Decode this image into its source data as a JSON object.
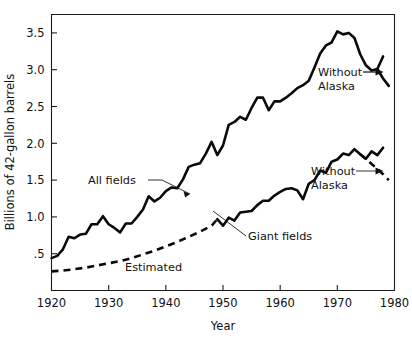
{
  "chart_data": {
    "type": "line",
    "title": "",
    "xlabel": "Year",
    "ylabel": "Billions of 42-gallon barrels",
    "xlim": [
      1920,
      1980
    ],
    "ylim": [
      0,
      3.75
    ],
    "grid": false,
    "legend_position": "inline-annotations",
    "x_ticks": [
      1920,
      1930,
      1940,
      1950,
      1960,
      1970,
      1980
    ],
    "x_tick_labels": [
      "1920",
      "1930",
      "1940",
      "1950",
      "1960",
      "1970",
      "1980"
    ],
    "y_ticks": [
      0.5,
      1.0,
      1.5,
      2.0,
      2.5,
      3.0,
      3.5
    ],
    "y_tick_labels": [
      ".5",
      "1.0",
      "1.5",
      "2.0",
      "2.5",
      "3.0",
      "3.5"
    ],
    "annotations": [
      {
        "text": "All fields",
        "x": 1931.0,
        "y": 1.62
      },
      {
        "text": "Without Alaska",
        "line1": "Without",
        "line2": "Alaska",
        "x": 1968.0,
        "y": 2.72
      },
      {
        "text": "Without Alaska",
        "line1": "Without",
        "line2": "Alaska",
        "x": 1967.0,
        "y": 1.52
      },
      {
        "text": "Giant fields",
        "x": 1956.5,
        "y": 0.7
      },
      {
        "text": "Estimated",
        "x": 1936.0,
        "y": 0.27
      }
    ],
    "series": [
      {
        "name": "All fields",
        "style": "solid",
        "x": [
          1920,
          1921,
          1922,
          1923,
          1924,
          1925,
          1926,
          1927,
          1928,
          1929,
          1930,
          1931,
          1932,
          1933,
          1934,
          1935,
          1936,
          1937,
          1938,
          1939,
          1940,
          1941,
          1942,
          1943,
          1944,
          1945,
          1946,
          1947,
          1948,
          1949,
          1950,
          1951,
          1952,
          1953,
          1954,
          1955,
          1956,
          1957,
          1958,
          1959,
          1960,
          1961,
          1962,
          1963,
          1964,
          1965,
          1966,
          1967,
          1968,
          1969,
          1970,
          1971,
          1972,
          1973,
          1974,
          1975,
          1976,
          1977,
          1978
        ],
        "values": [
          0.44,
          0.47,
          0.56,
          0.73,
          0.71,
          0.76,
          0.77,
          0.9,
          0.9,
          1.01,
          0.9,
          0.85,
          0.79,
          0.91,
          0.91,
          1.0,
          1.1,
          1.28,
          1.21,
          1.26,
          1.35,
          1.4,
          1.39,
          1.51,
          1.68,
          1.71,
          1.73,
          1.86,
          2.02,
          1.84,
          1.97,
          2.25,
          2.29,
          2.36,
          2.32,
          2.48,
          2.62,
          2.62,
          2.45,
          2.57,
          2.57,
          2.62,
          2.68,
          2.75,
          2.79,
          2.85,
          3.03,
          3.22,
          3.33,
          3.37,
          3.52,
          3.48,
          3.5,
          3.43,
          3.21,
          3.06,
          2.99,
          3.01,
          3.18
        ],
        "fork": {
          "at_year": 1977,
          "branch_name": "Without Alaska",
          "branch_style": "solid",
          "branch_x": [
            1977,
            1978,
            1979
          ],
          "branch_values": [
            3.01,
            2.88,
            2.78
          ]
        }
      },
      {
        "name": "Giant fields",
        "style": "dashed-then-solid",
        "estimated_until": 1949,
        "x": [
          1920,
          1922,
          1924,
          1926,
          1928,
          1930,
          1932,
          1934,
          1936,
          1938,
          1940,
          1942,
          1944,
          1946,
          1948,
          1949,
          1950,
          1951,
          1952,
          1953,
          1954,
          1955,
          1956,
          1957,
          1958,
          1959,
          1960,
          1961,
          1962,
          1963,
          1964,
          1965,
          1966,
          1967,
          1968,
          1969,
          1970,
          1971,
          1972,
          1973,
          1974,
          1975,
          1976,
          1977,
          1978
        ],
        "values": [
          0.26,
          0.27,
          0.29,
          0.31,
          0.34,
          0.37,
          0.4,
          0.44,
          0.49,
          0.54,
          0.6,
          0.66,
          0.73,
          0.8,
          0.88,
          0.97,
          0.88,
          0.99,
          0.95,
          1.06,
          1.07,
          1.08,
          1.16,
          1.22,
          1.22,
          1.29,
          1.34,
          1.38,
          1.39,
          1.36,
          1.24,
          1.45,
          1.5,
          1.63,
          1.6,
          1.75,
          1.78,
          1.86,
          1.84,
          1.92,
          1.85,
          1.79,
          1.89,
          1.84,
          1.94
        ],
        "fork": {
          "at_year": 1974,
          "branch_name": "Without Alaska",
          "branch_style": "dashed",
          "branch_x": [
            1974,
            1976,
            1978,
            1979
          ],
          "branch_values": [
            1.85,
            1.72,
            1.58,
            1.5
          ]
        }
      }
    ]
  },
  "colors": {
    "ink": "#111111",
    "background": "#ffffff",
    "series": "#0a0a0a"
  }
}
